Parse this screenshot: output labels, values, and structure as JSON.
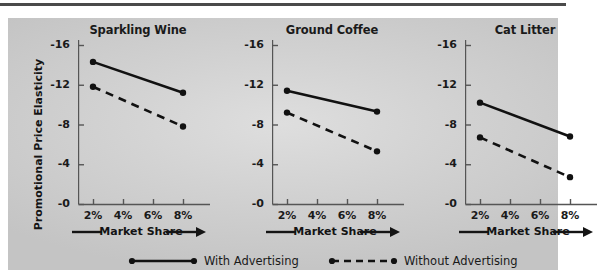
{
  "figure": {
    "y_axis_title": "Promotional Price Elasticity",
    "x_axis_caption": "Market Share"
  },
  "legend": {
    "with_label": "With Advertising",
    "without_label": "Without Advertising"
  },
  "chart_data": {
    "type": "line",
    "title": "",
    "xlabel": "Market Share",
    "ylabel": "Promotional Price Elasticity",
    "x": [
      "2%",
      "4%",
      "6%",
      "8%"
    ],
    "x_numeric": [
      2,
      4,
      6,
      8
    ],
    "xlim": [
      1,
      9
    ],
    "ylim": [
      0,
      -16
    ],
    "ytick_labels": [
      "-16",
      "-12",
      "-8",
      "-4",
      "-0"
    ],
    "yticks": [
      -16,
      -12,
      -8,
      -4,
      0
    ],
    "grid": false,
    "legend_position": "bottom",
    "panels": [
      {
        "title": "Sparkling Wine",
        "series": [
          {
            "name": "With Advertising",
            "style": "solid",
            "x": [
              2,
              8
            ],
            "values": [
              -14.3,
              -11.2
            ]
          },
          {
            "name": "Without Advertising",
            "style": "dashed",
            "x": [
              2,
              8
            ],
            "values": [
              -11.8,
              -7.8
            ]
          }
        ]
      },
      {
        "title": "Ground Coffee",
        "series": [
          {
            "name": "With Advertising",
            "style": "solid",
            "x": [
              2,
              8
            ],
            "values": [
              -11.4,
              -9.3
            ]
          },
          {
            "name": "Without Advertising",
            "style": "dashed",
            "x": [
              2,
              8
            ],
            "values": [
              -9.2,
              -5.3
            ]
          }
        ]
      },
      {
        "title": "Cat Litter",
        "series": [
          {
            "name": "With Advertising",
            "style": "solid",
            "x": [
              2,
              8
            ],
            "values": [
              -10.2,
              -6.8
            ]
          },
          {
            "name": "Without Advertising",
            "style": "dashed",
            "x": [
              2,
              8
            ],
            "values": [
              -6.7,
              -2.7
            ]
          }
        ]
      }
    ],
    "colors": {
      "line": "#111111",
      "axis": "#555555",
      "panel_background": "#d2d2d2",
      "text": "#1a1a1a"
    }
  }
}
